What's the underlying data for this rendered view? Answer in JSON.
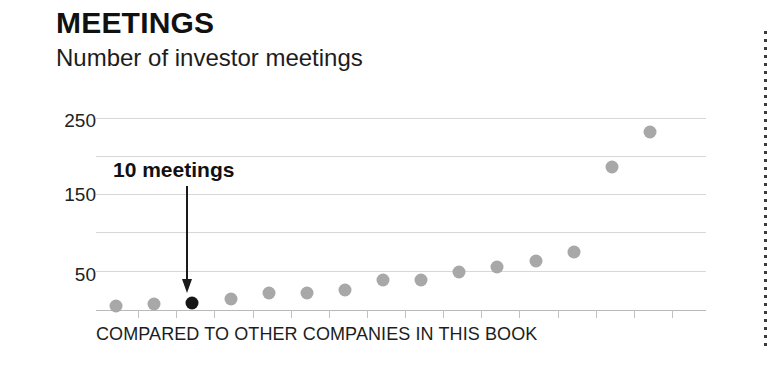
{
  "chart_data": {
    "type": "scatter",
    "title": "MEETINGS",
    "subtitle": "Number of investor meetings",
    "xlabel": "COMPARED TO OTHER COMPANIES IN THIS BOOK",
    "ylabel": "",
    "ylim": [
      0,
      265
    ],
    "grid": true,
    "legend": "none",
    "ytick_labels": [
      "250",
      "150",
      "50"
    ],
    "ytick_values": [
      250,
      150,
      50
    ],
    "gridline_values": [
      250,
      200,
      150,
      100,
      50
    ],
    "x": [
      1,
      2,
      3,
      4,
      5,
      6,
      7,
      8,
      9,
      10,
      11,
      12,
      13,
      14,
      15
    ],
    "values": [
      5,
      8,
      10,
      15,
      23,
      23,
      27,
      42,
      42,
      52,
      60,
      67,
      80,
      198,
      245
    ],
    "highlight_index": 2,
    "highlight_value": 10,
    "annotation": "10 meetings",
    "colors": {
      "dot": "#a8a8a8",
      "highlight_dot": "#161616",
      "gridline": "#d8d8d8",
      "axis": "#b9b9b9",
      "text": "#1a1a1a"
    }
  }
}
